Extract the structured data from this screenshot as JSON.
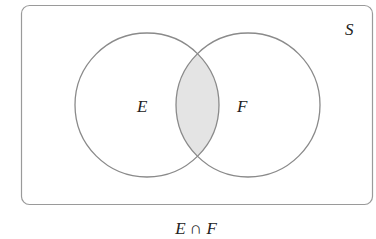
{
  "diagram": {
    "type": "venn",
    "universe_label": "S",
    "sets": [
      {
        "label": "E"
      },
      {
        "label": "F"
      }
    ],
    "shaded_region": "intersection",
    "caption": "E ∩ F",
    "colors": {
      "stroke": "#8a8a8a",
      "shade": "#e4e4e4",
      "text": "#222222"
    }
  }
}
